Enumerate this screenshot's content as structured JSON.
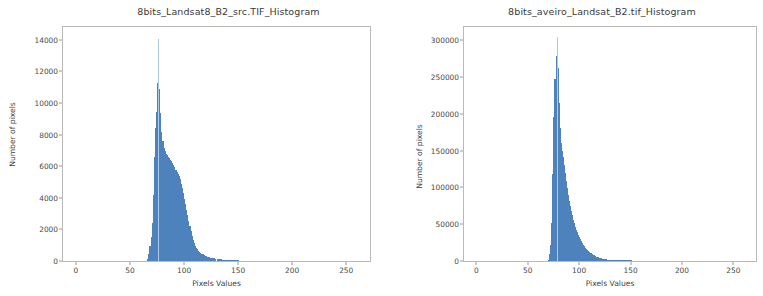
{
  "figure": {
    "width": 763,
    "height": 296,
    "background": "#ffffff",
    "bar_color": "#4e82bd",
    "spike_color": "#a9cbe8",
    "frame_color": "#b9b9b9"
  },
  "chart_data": [
    {
      "type": "bar",
      "title": "8bits_Landsat8_B2_src.TIF_Histogram",
      "xlabel": "Pixels Values",
      "ylabel": "Number of pixels",
      "xlim": [
        -12,
        272
      ],
      "ylim": [
        0,
        14800
      ],
      "xticks": [
        0,
        50,
        100,
        150,
        200,
        250
      ],
      "xtick_labels": [
        "0",
        "50",
        "100",
        "150",
        "200",
        "250"
      ],
      "yticks": [
        0,
        2000,
        4000,
        6000,
        8000,
        10000,
        12000,
        14000
      ],
      "ytick_labels": [
        "0",
        "2000",
        "4000",
        "6000",
        "8000",
        "10000",
        "12000",
        "14000"
      ],
      "grid": false,
      "legend": null,
      "x": [
        66,
        67,
        68,
        69,
        70,
        71,
        72,
        73,
        74,
        75,
        76,
        77,
        78,
        79,
        80,
        81,
        82,
        83,
        84,
        85,
        86,
        87,
        88,
        89,
        90,
        91,
        92,
        93,
        94,
        95,
        96,
        97,
        98,
        99,
        100,
        101,
        102,
        103,
        104,
        105,
        106,
        107,
        108,
        109,
        110,
        111,
        112,
        113,
        114,
        115,
        116,
        117,
        118,
        119,
        120,
        121,
        122,
        123,
        124,
        125,
        126,
        127,
        128,
        129,
        130,
        131,
        132,
        133,
        134,
        135,
        136,
        137,
        138,
        139,
        140,
        141,
        142,
        143,
        144,
        145,
        146,
        147,
        148,
        149,
        150
      ],
      "values": [
        120,
        420,
        980,
        1500,
        2400,
        4200,
        6600,
        8400,
        9400,
        11250,
        14050,
        10900,
        9350,
        8150,
        7600,
        7150,
        6950,
        6800,
        6700,
        6600,
        6500,
        6400,
        6320,
        6220,
        6100,
        5950,
        5780,
        5620,
        5500,
        5400,
        5200,
        4900,
        4600,
        4300,
        3950,
        3600,
        3250,
        2900,
        2550,
        2200,
        1900,
        1600,
        1350,
        1150,
        980,
        840,
        730,
        640,
        570,
        510,
        460,
        415,
        375,
        340,
        310,
        285,
        262,
        240,
        222,
        205,
        190,
        176,
        163,
        151,
        140,
        130,
        120,
        111,
        103,
        95,
        88,
        81,
        75,
        69,
        64,
        59,
        54,
        50,
        46,
        42,
        38,
        35,
        32,
        29,
        26
      ],
      "spike": {
        "x": 76,
        "value": 14050,
        "note": "tall narrow light-blue spike at peak"
      },
      "peak": {
        "x": 76,
        "value": 14050
      }
    },
    {
      "type": "bar",
      "title": "8bits_aveiro_Landsat_B2.tif_Histogram",
      "xlabel": "Pixels Values",
      "ylabel": "Number of pixels",
      "xlim": [
        -12,
        272
      ],
      "ylim": [
        0,
        318000
      ],
      "xticks": [
        0,
        50,
        100,
        150,
        200,
        250
      ],
      "xtick_labels": [
        "0",
        "50",
        "100",
        "150",
        "200",
        "250"
      ],
      "yticks": [
        0,
        50000,
        100000,
        150000,
        200000,
        250000,
        300000
      ],
      "ytick_labels": [
        "0",
        "50000",
        "100000",
        "150000",
        "200000",
        "250000",
        "300000"
      ],
      "grid": false,
      "legend": null,
      "x": [
        70,
        71,
        72,
        73,
        74,
        75,
        76,
        77,
        78,
        79,
        80,
        81,
        82,
        83,
        84,
        85,
        86,
        87,
        88,
        89,
        90,
        91,
        92,
        93,
        94,
        95,
        96,
        97,
        98,
        99,
        100,
        101,
        102,
        103,
        104,
        105,
        106,
        107,
        108,
        109,
        110,
        111,
        112,
        113,
        114,
        115,
        116,
        117,
        118,
        119,
        120,
        121,
        122,
        123,
        124,
        125,
        126,
        127,
        128,
        129,
        130,
        131,
        132,
        133,
        134,
        135,
        136,
        137,
        138,
        139,
        140,
        141,
        142,
        143,
        144,
        145,
        146,
        147,
        148,
        149,
        150
      ],
      "values": [
        2000,
        9000,
        22000,
        52000,
        118000,
        196000,
        248000,
        279000,
        305000,
        262000,
        215000,
        181000,
        160000,
        150000,
        141000,
        131000,
        120000,
        109000,
        99000,
        90000,
        82000,
        75000,
        68000,
        62000,
        56000,
        51000,
        46500,
        42500,
        39000,
        35500,
        32500,
        29500,
        27000,
        24500,
        22200,
        20000,
        18000,
        16200,
        14600,
        13100,
        11800,
        10600,
        9500,
        8500,
        7600,
        6800,
        6100,
        5450,
        4900,
        4400,
        3950,
        3550,
        3200,
        2880,
        2590,
        2330,
        2100,
        1890,
        1700,
        1530,
        1380,
        1240,
        1120,
        1010,
        910,
        820,
        740,
        665,
        600,
        540,
        486,
        437,
        394,
        354,
        319,
        287,
        258,
        232,
        209,
        188,
        169
      ],
      "spike": {
        "x": 78,
        "value": 305000,
        "note": "tall narrow light-blue spike at peak"
      },
      "peak": {
        "x": 78,
        "value": 305000
      }
    }
  ]
}
